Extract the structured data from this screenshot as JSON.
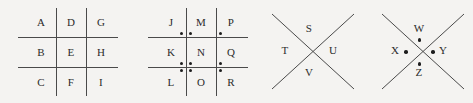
{
  "diagram": {
    "type": "cipher-key",
    "background_color": "#f4f3f1",
    "line_color": "#4a4a4a",
    "dot_color": "#1d1d1d",
    "text_color": "#2b2b2b"
  },
  "panels": [
    {
      "id": "grid-plain",
      "shape": "tic-tac-toe-grid",
      "dots": false,
      "rows": [
        [
          "A",
          "D",
          "G"
        ],
        [
          "B",
          "E",
          "H"
        ],
        [
          "C",
          "F",
          "I"
        ]
      ]
    },
    {
      "id": "grid-dotted",
      "shape": "tic-tac-toe-grid",
      "dots": true,
      "rows": [
        [
          "J",
          "M",
          "P"
        ],
        [
          "K",
          "N",
          "Q"
        ],
        [
          "L",
          "O",
          "R"
        ]
      ],
      "dot_positions": [
        [
          "bottom-right",
          "bottom-left",
          "bottom-left"
        ],
        [
          "bottom-right",
          "bottom-left",
          "bottom-left"
        ],
        [
          "top-right",
          "top-left",
          "top-left"
        ]
      ]
    },
    {
      "id": "cross-plain",
      "shape": "x-cross",
      "dots": false,
      "letters": {
        "top": "S",
        "left": "T",
        "right": "U",
        "bottom": "V"
      }
    },
    {
      "id": "cross-dotted",
      "shape": "x-cross",
      "dots": true,
      "letters": {
        "top": "W",
        "left": "X",
        "right": "Y",
        "bottom": "Z"
      }
    }
  ]
}
